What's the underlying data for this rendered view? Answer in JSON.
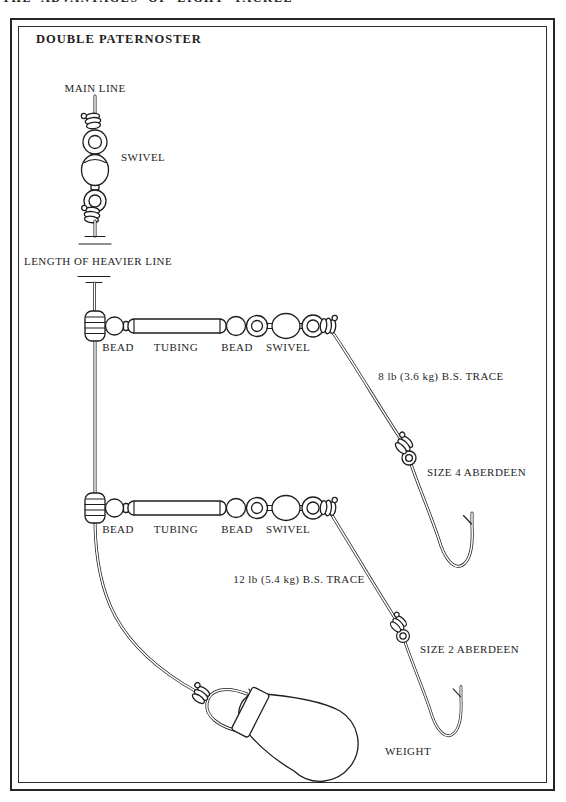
{
  "page": {
    "running_header": "THE ADVANTAGES OF LIGHT TACKLE",
    "title": "DOUBLE PATERNOSTER",
    "ink_color": "#1e1e1e",
    "paper_color": "#ffffff"
  },
  "rig": {
    "main_line_label": "MAIN LINE",
    "swivel_label": "SWIVEL",
    "heavier_line_label": "LENGTH OF HEAVIER LINE",
    "boom1": {
      "bead_left": "BEAD",
      "tubing": "TUBING",
      "bead_right": "BEAD",
      "swivel": "SWIVEL",
      "trace": "8 lb (3.6 kg) B.S. TRACE",
      "hook": "SIZE 4 ABERDEEN"
    },
    "boom2": {
      "bead_left": "BEAD",
      "tubing": "TUBING",
      "bead_right": "BEAD",
      "swivel": "SWIVEL",
      "trace": "12 lb (5.4 kg) B.S. TRACE",
      "hook": "SIZE 2 ABERDEEN"
    },
    "weight_label": "WEIGHT"
  }
}
